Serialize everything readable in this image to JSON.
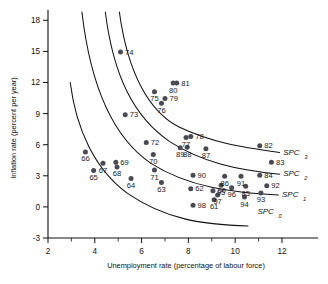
{
  "chart_data": {
    "type": "scatter",
    "title": "",
    "xlabel": "Unemployment rate (percentage of labour force)",
    "ylabel": "Inflation rate (percent per year)",
    "xlim": [
      2,
      12.6
    ],
    "ylim": [
      -3,
      18.8
    ],
    "xticks": [
      2,
      4,
      6,
      8,
      10,
      12
    ],
    "xticks_minor": [
      3,
      5,
      7,
      9,
      11
    ],
    "yticks": [
      -3,
      0,
      3,
      6,
      9,
      12,
      15,
      18
    ],
    "grid": false,
    "legend": "none",
    "points": [
      {
        "label": "60",
        "x": 9.05,
        "y": 1.55
      },
      {
        "label": "61",
        "x": 9.1,
        "y": 0.7
      },
      {
        "label": "62",
        "x": 8.1,
        "y": 1.75
      },
      {
        "label": "63",
        "x": 6.85,
        "y": 2.35
      },
      {
        "label": "64",
        "x": 5.55,
        "y": 2.75
      },
      {
        "label": "65",
        "x": 3.95,
        "y": 3.5
      },
      {
        "label": "66",
        "x": 3.6,
        "y": 5.3
      },
      {
        "label": "67",
        "x": 4.35,
        "y": 4.2
      },
      {
        "label": "68",
        "x": 4.95,
        "y": 3.85
      },
      {
        "label": "69",
        "x": 4.9,
        "y": 4.3
      },
      {
        "label": "70",
        "x": 6.5,
        "y": 5.05
      },
      {
        "label": "71",
        "x": 6.55,
        "y": 3.55
      },
      {
        "label": "72",
        "x": 6.2,
        "y": 6.2
      },
      {
        "label": "73",
        "x": 5.3,
        "y": 8.9
      },
      {
        "label": "74",
        "x": 5.1,
        "y": 14.95
      },
      {
        "label": "75",
        "x": 6.55,
        "y": 11.1
      },
      {
        "label": "76",
        "x": 6.85,
        "y": 10.0
      },
      {
        "label": "77",
        "x": 7.9,
        "y": 6.7
      },
      {
        "label": "78",
        "x": 8.1,
        "y": 6.8
      },
      {
        "label": "79",
        "x": 7.0,
        "y": 10.45
      },
      {
        "label": "80",
        "x": 7.35,
        "y": 11.95
      },
      {
        "label": "81",
        "x": 7.5,
        "y": 11.95
      },
      {
        "label": "82",
        "x": 11.05,
        "y": 5.9
      },
      {
        "label": "83",
        "x": 11.55,
        "y": 4.3
      },
      {
        "label": "84",
        "x": 11.05,
        "y": 3.05
      },
      {
        "label": "85",
        "x": 10.45,
        "y": 2.0
      },
      {
        "label": "86",
        "x": 9.55,
        "y": 2.95
      },
      {
        "label": "87",
        "x": 8.75,
        "y": 5.6
      },
      {
        "label": "88",
        "x": 7.95,
        "y": 5.75
      },
      {
        "label": "89",
        "x": 7.65,
        "y": 5.7
      },
      {
        "label": "90",
        "x": 8.2,
        "y": 3.05
      },
      {
        "label": "91",
        "x": 10.25,
        "y": 2.95
      },
      {
        "label": "92",
        "x": 11.35,
        "y": 2.05
      },
      {
        "label": "93",
        "x": 11.1,
        "y": 1.35
      },
      {
        "label": "94",
        "x": 10.4,
        "y": 0.95
      },
      {
        "label": "95",
        "x": 9.4,
        "y": 2.1
      },
      {
        "label": "96",
        "x": 9.85,
        "y": 1.85
      },
      {
        "label": "97",
        "x": 9.25,
        "y": 1.15
      },
      {
        "label": "98",
        "x": 8.2,
        "y": 0.15
      }
    ],
    "curves": [
      {
        "name": "SPC",
        "subscript": "3",
        "label_x": 12.05,
        "label_y": 5.0,
        "path": "M 5.05,18.8 C 5.4,13.0 6.3,9.2 7.6,7.7 C 9.0,6.2 10.2,5.8 11.9,5.25"
      },
      {
        "name": "SPC",
        "subscript": "2",
        "label_x": 12.05,
        "label_y": 2.95,
        "path": "M 4.45,18.8 C 4.8,12.5 5.7,8.6 7.2,6.3 C 8.6,4.3 10.0,3.6 11.9,3.15"
      },
      {
        "name": "SPC",
        "subscript": "1",
        "label_x": 12.0,
        "label_y": 0.95,
        "path": "M 3.45,18.8 C 3.85,11.0 4.9,6.5 6.4,4.2 C 8.0,1.9 9.9,1.35 11.85,1.15"
      },
      {
        "name": "SPC",
        "subscript": "0",
        "label_x": 10.95,
        "label_y": -0.7,
        "path": "M 2.95,12.0 C 3.2,7.5 4.0,3.6 5.4,1.3 C 7.0,-1.2 8.6,-1.7 10.55,-1.85"
      }
    ]
  }
}
